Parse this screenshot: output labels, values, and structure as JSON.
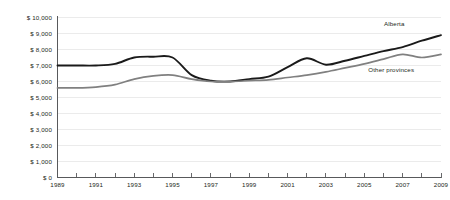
{
  "chart_data": {
    "type": "line",
    "title": "",
    "subtitle": "",
    "xlabel": "",
    "ylabel": "",
    "xlim": [
      1989,
      2009
    ],
    "ylim": [
      0,
      10000
    ],
    "grid": true,
    "legend_position": "inline-right",
    "x": [
      1989,
      1990,
      1991,
      1992,
      1993,
      1994,
      1995,
      1996,
      1997,
      1998,
      1999,
      2000,
      2001,
      2002,
      2003,
      2004,
      2005,
      2006,
      2007,
      2008,
      2009
    ],
    "series": [
      {
        "name": "Alberta",
        "color": "#1a1a1a",
        "values": [
          7000,
          7000,
          7000,
          7100,
          7500,
          7550,
          7500,
          6400,
          6050,
          6000,
          6150,
          6300,
          6900,
          7450,
          7050,
          7300,
          7600,
          7900,
          8150,
          8550,
          8900
        ]
      },
      {
        "name": "Other provinces",
        "color": "#808080",
        "values": [
          5600,
          5600,
          5650,
          5800,
          6150,
          6350,
          6400,
          6150,
          6000,
          6000,
          6050,
          6100,
          6250,
          6400,
          6600,
          6850,
          7100,
          7400,
          7700,
          7500,
          7700
        ]
      }
    ],
    "y_ticks": [
      {
        "value": 0,
        "label": "$ 0"
      },
      {
        "value": 1000,
        "label": "$ 1,000"
      },
      {
        "value": 2000,
        "label": "$ 2,000"
      },
      {
        "value": 3000,
        "label": "$ 3,000"
      },
      {
        "value": 4000,
        "label": "$ 4,000"
      },
      {
        "value": 5000,
        "label": "$ 5,000"
      },
      {
        "value": 6000,
        "label": "$ 6,000"
      },
      {
        "value": 7000,
        "label": "$ 7,000"
      },
      {
        "value": 8000,
        "label": "$ 8,000"
      },
      {
        "value": 9000,
        "label": "$ 9,000"
      },
      {
        "value": 10000,
        "label": "$ 10,000"
      }
    ],
    "x_ticks": [
      {
        "value": 1989,
        "label": "1989"
      },
      {
        "value": 1990,
        "label": ""
      },
      {
        "value": 1991,
        "label": "1991"
      },
      {
        "value": 1992,
        "label": ""
      },
      {
        "value": 1993,
        "label": "1993"
      },
      {
        "value": 1994,
        "label": ""
      },
      {
        "value": 1995,
        "label": "1995"
      },
      {
        "value": 1996,
        "label": ""
      },
      {
        "value": 1997,
        "label": "1997"
      },
      {
        "value": 1998,
        "label": ""
      },
      {
        "value": 1999,
        "label": "1999"
      },
      {
        "value": 2000,
        "label": ""
      },
      {
        "value": 2001,
        "label": "2001"
      },
      {
        "value": 2002,
        "label": ""
      },
      {
        "value": 2003,
        "label": "2003"
      },
      {
        "value": 2004,
        "label": ""
      },
      {
        "value": 2005,
        "label": "2005"
      },
      {
        "value": 2006,
        "label": ""
      },
      {
        "value": 2007,
        "label": "2007"
      },
      {
        "value": 2008,
        "label": ""
      },
      {
        "value": 2009,
        "label": "2009"
      }
    ],
    "annotations": [
      {
        "text": "Alberta",
        "series": "Alberta",
        "x": 2007.1,
        "y": 9450
      },
      {
        "text": "Other provinces",
        "series": "Other provinces",
        "x": 2007.6,
        "y": 6600
      }
    ]
  }
}
